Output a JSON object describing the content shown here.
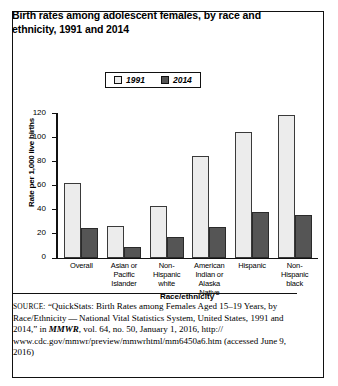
{
  "figure": {
    "title": "Birth rates among adolescent females, by race and ethnicity, 1991 and 2014"
  },
  "legend": {
    "items": [
      {
        "label": "1991",
        "color": "#ececec",
        "swatch": "legend-swatch-1991"
      },
      {
        "label": "2014",
        "color": "#555555",
        "swatch": "legend-swatch-2014"
      }
    ]
  },
  "axes": {
    "ylabel": "Rate per 1,000 live births",
    "xlabel": "Race/ethnicity",
    "yticks": [
      "120",
      "100",
      "80",
      "60",
      "40",
      "20",
      "0"
    ]
  },
  "source": {
    "prefix": "SOURCE:",
    "line1": " “QuickStats: Birth Rates among Females Aged 15–19 Years,",
    "line2": "by Race/Ethnicity — National Vital Statistics System, United States,",
    "line3a": "1991 and 2014,” in ",
    "journal": "MMWR",
    "line3b": ", vol. 64, no. 50, January 1, 2016, http://",
    "line4": "www.cdc.gov/mmwr/preview/mmwrhtml/mm6450a6.htm (accessed",
    "line5": "June 9, 2016)"
  },
  "chart_data": {
    "type": "bar",
    "title": "Birth rates among adolescent females, by race and ethnicity, 1991 and 2014",
    "xlabel": "Race/ethnicity",
    "ylabel": "Rate per 1,000 live births",
    "ylim": [
      0,
      120
    ],
    "ytick_step": 20,
    "grid": false,
    "legend_position": "top-center",
    "categories": [
      "Overall",
      "Asian or Pacific Islander",
      "Non-Hispanic white",
      "American Indian or Alaska Native",
      "Hispanic",
      "Non-Hispanic black"
    ],
    "category_lines": [
      [
        "Overall"
      ],
      [
        "Asian or",
        "Pacific",
        "Islander"
      ],
      [
        "Non-",
        "Hispanic",
        "white"
      ],
      [
        "American",
        "Indian or",
        "Alaska Native"
      ],
      [
        "Hispanic"
      ],
      [
        "Non-",
        "Hispanic",
        "black"
      ]
    ],
    "series": [
      {
        "name": "1991",
        "color": "#ececec",
        "values": [
          61.8,
          26.0,
          43.0,
          84.0,
          104.0,
          118.0
        ]
      },
      {
        "name": "2014",
        "color": "#555555",
        "values": [
          24.2,
          9.0,
          17.0,
          25.0,
          38.0,
          34.9
        ]
      }
    ]
  }
}
